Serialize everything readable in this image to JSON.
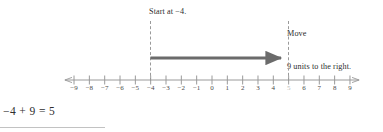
{
  "figure": {
    "type": "number-line-addition-diagram",
    "annotations": {
      "start_label": "Start at −4.",
      "move_label_line1": "Move",
      "move_label_line2": "9 units to the right."
    },
    "equation": "−4 + 9 = 5",
    "axis": {
      "min": -9,
      "max": 9,
      "tick_labels": [
        "−9",
        "−8",
        "−7",
        "−6",
        "−5",
        "−4",
        "−3",
        "−2",
        "−1",
        "0",
        "1",
        "2",
        "3",
        "4",
        "5",
        "6",
        "7",
        "8",
        "9"
      ],
      "tick_values": [
        -9,
        -8,
        -7,
        -6,
        -5,
        -4,
        -3,
        -2,
        -1,
        0,
        1,
        2,
        3,
        4,
        5,
        6,
        7,
        8,
        9
      ],
      "dimmed_tick_value": 5,
      "left_arrowhead": true,
      "right_arrowhead": true
    },
    "jump": {
      "start_value": -4,
      "end_value": 5,
      "magnitude": 9,
      "direction": "right"
    },
    "guides": {
      "left_guide_value": -4,
      "right_guide_value": 5
    },
    "colors": {
      "axis": "#9a9a9a",
      "tick_label": "#4a4a4a",
      "dim_tick_label": "#b9b9b9",
      "arrow": "#6b6b6b",
      "guide": "#9a9a9a",
      "text": "#2e2e2e",
      "rule": "#c2c2c2"
    }
  }
}
